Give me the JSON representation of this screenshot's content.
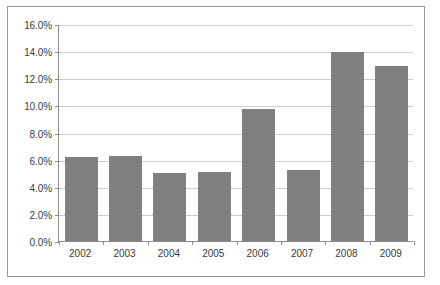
{
  "chart_data": {
    "type": "bar",
    "title": "",
    "subtitle": "",
    "xlabel": "",
    "ylabel": "",
    "categories": [
      "2002",
      "2003",
      "2004",
      "2005",
      "2006",
      "2007",
      "2008",
      "2009"
    ],
    "values": [
      6.2,
      6.3,
      5.0,
      5.1,
      9.7,
      5.2,
      13.9,
      12.9
    ],
    "value_format": "percent",
    "ylim": [
      0,
      16
    ],
    "ytick_values": [
      0,
      2,
      4,
      6,
      8,
      10,
      12,
      14,
      16
    ],
    "ytick_labels": [
      "0.0%",
      "2.0%",
      "4.0%",
      "6.0%",
      "8.0%",
      "10.0%",
      "12.0%",
      "14.0%",
      "16.0%"
    ],
    "grid": true,
    "grid_axis": "y",
    "legend": false,
    "legend_position": "none",
    "series": [
      {
        "name": "Series 1",
        "color": "#808080",
        "values": [
          6.2,
          6.3,
          5.0,
          5.1,
          9.7,
          5.2,
          13.9,
          12.9
        ]
      }
    ]
  },
  "style": {
    "bar_color": "#808080",
    "grid_color": "#cdcdcd",
    "axis_color": "#8c8c8c",
    "frame_color": "#9a9a9a",
    "text_color": "#3a3a3a",
    "background": "#ffffff"
  }
}
